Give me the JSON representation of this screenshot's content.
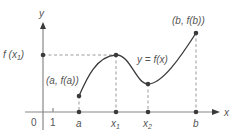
{
  "figure": {
    "labels": {
      "y_axis": "y",
      "x_axis": "x",
      "origin": "0",
      "tick_one": "1",
      "a": "a",
      "x1": "x",
      "x1_sub": "1",
      "x2": "x",
      "x2_sub": "2",
      "b": "b",
      "f_x1_prefix": "f (x",
      "f_x1_sub": "1",
      "f_x1_suffix": ")",
      "point_a": "(a, f(a))",
      "point_b": "(b, f(b))",
      "curve": "y = f(x)"
    },
    "points": [
      {
        "name": "a",
        "x": 79,
        "y": 112
      },
      {
        "name": "x1",
        "x": 116,
        "y": 112
      },
      {
        "name": "x2",
        "x": 148,
        "y": 112
      },
      {
        "name": "b",
        "x": 196,
        "y": 112
      },
      {
        "name": "f(a)",
        "x": 79,
        "y": 96
      },
      {
        "name": "f(x1)",
        "x": 116,
        "y": 55
      },
      {
        "name": "f(x2)",
        "x": 148,
        "y": 84
      },
      {
        "name": "f(b)",
        "x": 196,
        "y": 33
      },
      {
        "name": "f(x1) on y-axis",
        "x": 43,
        "y": 55
      }
    ],
    "colors": {
      "axis": "#888888",
      "curve": "#3a3a3a",
      "dash": "#9a9a9a",
      "text": "#555555"
    }
  }
}
